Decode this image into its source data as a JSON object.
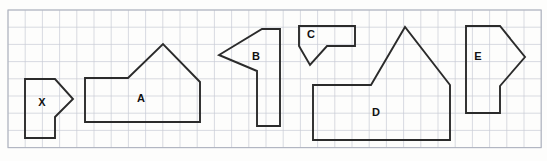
{
  "worksheet": {
    "title": "Grid paper geometry figures",
    "background_color": "#fdfdfc",
    "grid": {
      "origin_x": 8,
      "origin_y": 10,
      "cell_size": 17.2,
      "columns": 31,
      "rows": 8,
      "line_color": "#c9ccd6",
      "border_color": "#b0b4c0"
    },
    "outline_color": "#2b2b2b",
    "label_color": "#111111"
  },
  "figures": [
    {
      "id": "figure-x",
      "label": "X",
      "label_x": 42,
      "label_y": 103,
      "description": "rectangle with triangular point on right side",
      "points": "25,79 55,79 73,99 55,117 55,138 25,138"
    },
    {
      "id": "figure-a",
      "label": "A",
      "label_x": 141,
      "label_y": 99,
      "description": "house pentagon with long base",
      "points": "85,78 128,78 163,44 200,82 200,122 85,122"
    },
    {
      "id": "figure-b",
      "label": "B",
      "label_x": 256,
      "label_y": 57,
      "description": "flag shape with left point and narrow tail",
      "points": "262,29 280,29 280,126 257,126 257,71 219,55"
    },
    {
      "id": "figure-c",
      "label": "C",
      "label_x": 311,
      "label_y": 35,
      "description": "rectangle with triangular notch cut from bottom",
      "points": "299,26 355,26 355,46 327,46 310,65 299,46"
    },
    {
      "id": "figure-d",
      "label": "D",
      "label_x": 376,
      "label_y": 113,
      "description": "large house pentagon with long base",
      "points": "313,85 371,85 405,27 450,85 450,140 313,140"
    },
    {
      "id": "figure-e",
      "label": "E",
      "label_x": 478,
      "label_y": 57,
      "description": "rectangle with triangular point on right side",
      "points": "466,26 500,26 525,57 500,86 500,113 466,113"
    }
  ]
}
